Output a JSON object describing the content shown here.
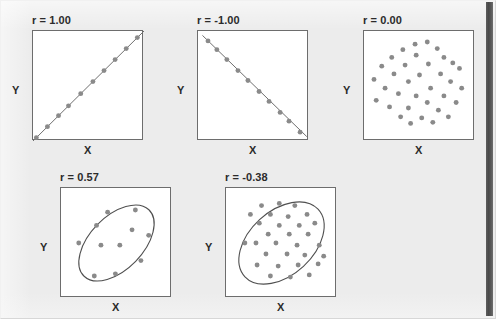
{
  "figure": {
    "background_color": "#ececec",
    "panel_background_color": "#ffffff",
    "panel_border_color": "#6d6d6d",
    "dot_color": "#8a8a8a",
    "line_color": "#6f6f6f",
    "text_color": "#2b2b2b",
    "scan_edge_color": "#4a4a4a"
  },
  "labels": {
    "x": "X",
    "y": "Y"
  },
  "chart_data": [
    {
      "type": "scatter",
      "title": "r = 1.00",
      "r": 1.0,
      "xlabel": "X",
      "ylabel": "Y",
      "xlim": [
        0,
        100
      ],
      "ylim": [
        0,
        100
      ],
      "grid": false,
      "legend": "none",
      "annotation": "perfect positive linear relationship; points lie exactly on an upward line",
      "trend_line": {
        "x1": 0,
        "y1": 0,
        "x2": 100,
        "y2": 100
      },
      "points": [
        {
          "x": 3,
          "y": 3
        },
        {
          "x": 13,
          "y": 13
        },
        {
          "x": 23,
          "y": 23
        },
        {
          "x": 32,
          "y": 32
        },
        {
          "x": 43,
          "y": 43
        },
        {
          "x": 54,
          "y": 54
        },
        {
          "x": 64,
          "y": 64
        },
        {
          "x": 74,
          "y": 74
        },
        {
          "x": 84,
          "y": 84
        },
        {
          "x": 94,
          "y": 94
        }
      ]
    },
    {
      "type": "scatter",
      "title": "r = -1.00",
      "r": -1.0,
      "xlabel": "X",
      "ylabel": "Y",
      "xlim": [
        0,
        100
      ],
      "ylim": [
        0,
        100
      ],
      "grid": false,
      "legend": "none",
      "annotation": "perfect negative linear relationship; points lie exactly on a downward line",
      "trend_line": {
        "x1": 4,
        "y1": 96,
        "x2": 98,
        "y2": 4
      },
      "points": [
        {
          "x": 9,
          "y": 91
        },
        {
          "x": 17,
          "y": 83
        },
        {
          "x": 26,
          "y": 74
        },
        {
          "x": 36,
          "y": 64
        },
        {
          "x": 45,
          "y": 55
        },
        {
          "x": 55,
          "y": 45
        },
        {
          "x": 64,
          "y": 36
        },
        {
          "x": 74,
          "y": 26
        },
        {
          "x": 82,
          "y": 18
        },
        {
          "x": 92,
          "y": 8
        }
      ]
    },
    {
      "type": "scatter",
      "title": "r = 0.00",
      "r": 0.0,
      "xlabel": "X",
      "ylabel": "Y",
      "xlim": [
        0,
        100
      ],
      "ylim": [
        0,
        100
      ],
      "grid": false,
      "legend": "none",
      "annotation": "no linear relationship; points scattered in a circular cloud",
      "points": [
        {
          "x": 46,
          "y": 88
        },
        {
          "x": 57,
          "y": 90
        },
        {
          "x": 35,
          "y": 83
        },
        {
          "x": 66,
          "y": 84
        },
        {
          "x": 25,
          "y": 76
        },
        {
          "x": 47,
          "y": 78
        },
        {
          "x": 72,
          "y": 76
        },
        {
          "x": 80,
          "y": 71
        },
        {
          "x": 16,
          "y": 68
        },
        {
          "x": 37,
          "y": 69
        },
        {
          "x": 58,
          "y": 70
        },
        {
          "x": 86,
          "y": 66
        },
        {
          "x": 27,
          "y": 61
        },
        {
          "x": 50,
          "y": 60
        },
        {
          "x": 69,
          "y": 61
        },
        {
          "x": 9,
          "y": 56
        },
        {
          "x": 40,
          "y": 54
        },
        {
          "x": 78,
          "y": 54
        },
        {
          "x": 19,
          "y": 48
        },
        {
          "x": 60,
          "y": 48
        },
        {
          "x": 88,
          "y": 48
        },
        {
          "x": 31,
          "y": 43
        },
        {
          "x": 47,
          "y": 41
        },
        {
          "x": 72,
          "y": 41
        },
        {
          "x": 11,
          "y": 37
        },
        {
          "x": 57,
          "y": 35
        },
        {
          "x": 83,
          "y": 35
        },
        {
          "x": 23,
          "y": 31
        },
        {
          "x": 40,
          "y": 30
        },
        {
          "x": 67,
          "y": 28
        },
        {
          "x": 33,
          "y": 22
        },
        {
          "x": 52,
          "y": 21
        },
        {
          "x": 76,
          "y": 22
        },
        {
          "x": 42,
          "y": 16
        },
        {
          "x": 62,
          "y": 17
        }
      ]
    },
    {
      "type": "scatter",
      "title": "r = 0.57",
      "r": 0.57,
      "xlabel": "X",
      "ylabel": "Y",
      "xlim": [
        0,
        100
      ],
      "ylim": [
        0,
        100
      ],
      "grid": false,
      "legend": "none",
      "annotation": "moderate positive relationship; points enclosed by an ellipse tilted upward",
      "ellipse": {
        "cx": 50,
        "cy": 50,
        "rx": 42,
        "ry": 24,
        "rotation_deg": -46
      },
      "points": [
        {
          "x": 42,
          "y": 78
        },
        {
          "x": 67,
          "y": 80
        },
        {
          "x": 32,
          "y": 66
        },
        {
          "x": 64,
          "y": 62
        },
        {
          "x": 16,
          "y": 50
        },
        {
          "x": 36,
          "y": 48
        },
        {
          "x": 53,
          "y": 48
        },
        {
          "x": 79,
          "y": 57
        },
        {
          "x": 72,
          "y": 34
        },
        {
          "x": 30,
          "y": 20
        },
        {
          "x": 49,
          "y": 22
        }
      ]
    },
    {
      "type": "scatter",
      "title": "r = -0.38",
      "r": -0.38,
      "xlabel": "X",
      "ylabel": "Y",
      "xlim": [
        0,
        100
      ],
      "ylim": [
        0,
        100
      ],
      "grid": false,
      "legend": "none",
      "annotation": "weak relationship; dense cloud of points enclosed by a tilted ellipse",
      "ellipse": {
        "cx": 50,
        "cy": 50,
        "rx": 45,
        "ry": 29,
        "rotation_deg": -43
      },
      "points": [
        {
          "x": 32,
          "y": 84
        },
        {
          "x": 48,
          "y": 86
        },
        {
          "x": 62,
          "y": 84
        },
        {
          "x": 22,
          "y": 76
        },
        {
          "x": 40,
          "y": 76
        },
        {
          "x": 56,
          "y": 74
        },
        {
          "x": 73,
          "y": 76
        },
        {
          "x": 30,
          "y": 68
        },
        {
          "x": 48,
          "y": 66
        },
        {
          "x": 66,
          "y": 66
        },
        {
          "x": 80,
          "y": 68
        },
        {
          "x": 38,
          "y": 58
        },
        {
          "x": 57,
          "y": 58
        },
        {
          "x": 74,
          "y": 58
        },
        {
          "x": 17,
          "y": 50
        },
        {
          "x": 27,
          "y": 50
        },
        {
          "x": 45,
          "y": 50
        },
        {
          "x": 64,
          "y": 48
        },
        {
          "x": 84,
          "y": 48
        },
        {
          "x": 36,
          "y": 40
        },
        {
          "x": 55,
          "y": 40
        },
        {
          "x": 71,
          "y": 39
        },
        {
          "x": 88,
          "y": 38
        },
        {
          "x": 28,
          "y": 30
        },
        {
          "x": 47,
          "y": 29
        },
        {
          "x": 65,
          "y": 30
        },
        {
          "x": 83,
          "y": 31
        },
        {
          "x": 40,
          "y": 20
        },
        {
          "x": 58,
          "y": 19
        },
        {
          "x": 75,
          "y": 21
        }
      ]
    }
  ]
}
